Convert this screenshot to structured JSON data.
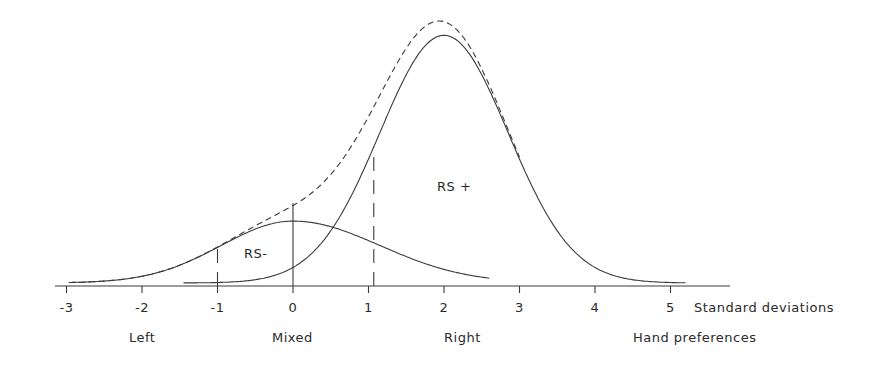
{
  "chart_data": {
    "type": "line",
    "title": "",
    "xlabel": "Standard deviations",
    "xlabel_secondary": "Hand preferences",
    "ylabel": "",
    "xlim": [
      -3.2,
      5.7
    ],
    "x_ticks": [
      -3,
      -2,
      -1,
      0,
      1,
      2,
      3,
      4,
      5
    ],
    "x_tick_labels": [
      "-3",
      "-2",
      "-1",
      "0",
      "1",
      "2",
      "3",
      "4",
      "5"
    ],
    "category_labels": [
      {
        "label": "Left",
        "x": -1.9
      },
      {
        "label": "Mixed",
        "x": 0
      },
      {
        "label": "Right",
        "x": 2
      },
      {
        "label": "Hand preferences",
        "x": 4.6
      }
    ],
    "grid": false,
    "legend": "none",
    "series": [
      {
        "name": "RS-",
        "style": "solid",
        "mean": 0,
        "sd": 1.0,
        "relative_peak": 0.24,
        "description": "Smaller normal distribution centered at 0 SD"
      },
      {
        "name": "RS+",
        "style": "solid",
        "mean": 2.0,
        "sd": 1.0,
        "relative_peak": 0.96,
        "description": "Larger normal distribution centered at 2 SD, extends from about -2.6 to 5.2"
      },
      {
        "name": "Sum (RS- + RS+)",
        "style": "dashed",
        "relative_peak": 1.0,
        "description": "Combined distribution, sum of the two curves"
      }
    ],
    "annotations": [
      {
        "text": "RS-",
        "x": -0.5,
        "y_rel": 0.14
      },
      {
        "text": "RS +",
        "x": 2.05,
        "y_rel": 0.35
      },
      {
        "type": "vline",
        "style": "dashed",
        "x": -1,
        "description": "Left / Mixed threshold"
      },
      {
        "type": "vline",
        "style": "solid",
        "x": 0,
        "description": "Mean of RS-"
      },
      {
        "type": "vline",
        "style": "dashed",
        "x": 1.07,
        "description": "Mixed / Right threshold"
      }
    ]
  },
  "axis": {
    "ticks": [
      "-3",
      "-2",
      "-1",
      "0",
      "1",
      "2",
      "3",
      "4",
      "5"
    ],
    "unit_label": "Standard deviations"
  },
  "labels": {
    "rs_minus": "RS-",
    "rs_plus": "RS +",
    "left": "Left",
    "mixed": "Mixed",
    "right": "Right",
    "hand_preferences": "Hand preferences"
  }
}
